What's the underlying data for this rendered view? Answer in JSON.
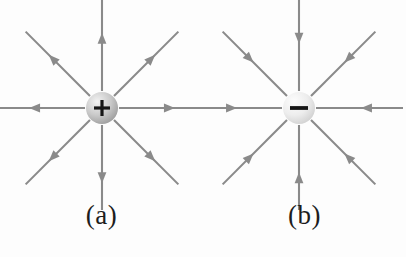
{
  "figure": {
    "background_color": "#fdfdfd",
    "line_color": "#8a8a8a",
    "sign_color": "#161616",
    "panels": [
      {
        "id": "a",
        "label": "(a)",
        "charge_sign": "+",
        "charge_polarity": "positive",
        "field_direction": "outward",
        "sphere": {
          "center_x": 102,
          "center_y": 108,
          "radius": 16,
          "highlight_color": "#f2f2f2",
          "mid_color": "#c9c9c9",
          "edge_color": "#9a9a9a"
        },
        "field_lines": [
          {
            "name": "up",
            "angle_deg": 270,
            "length": 92
          },
          {
            "name": "up-right",
            "angle_deg": 315,
            "length": 92
          },
          {
            "name": "right",
            "angle_deg": 0,
            "length": 88
          },
          {
            "name": "down-right",
            "angle_deg": 45,
            "length": 92
          },
          {
            "name": "down",
            "angle_deg": 90,
            "length": 92
          },
          {
            "name": "down-left",
            "angle_deg": 135,
            "length": 92
          },
          {
            "name": "left",
            "angle_deg": 180,
            "length": 88
          },
          {
            "name": "up-left",
            "angle_deg": 225,
            "length": 92
          }
        ]
      },
      {
        "id": "b",
        "label": "(b)",
        "charge_sign": "—",
        "charge_polarity": "negative",
        "field_direction": "inward",
        "sphere": {
          "center_x": 96,
          "center_y": 108,
          "radius": 16,
          "highlight_color": "#fdfdfd",
          "mid_color": "#ededed",
          "edge_color": "#cfcfcf"
        },
        "field_lines": [
          {
            "name": "up",
            "angle_deg": 270,
            "length": 92
          },
          {
            "name": "up-right",
            "angle_deg": 315,
            "length": 92
          },
          {
            "name": "right",
            "angle_deg": 0,
            "length": 88
          },
          {
            "name": "down-right",
            "angle_deg": 45,
            "length": 92
          },
          {
            "name": "down",
            "angle_deg": 90,
            "length": 92
          },
          {
            "name": "down-left",
            "angle_deg": 135,
            "length": 92
          },
          {
            "name": "left",
            "angle_deg": 180,
            "length": 88
          },
          {
            "name": "up-left",
            "angle_deg": 225,
            "length": 92
          }
        ]
      }
    ]
  }
}
